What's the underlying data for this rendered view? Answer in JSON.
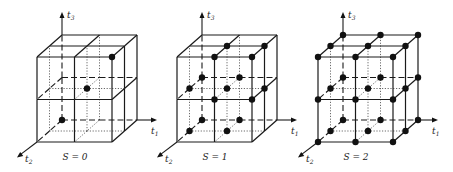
{
  "figure": {
    "background": "#ffffff",
    "ink_color": "#111111",
    "panels": [
      {
        "id": "s0",
        "caption": "S = 0",
        "origin_x": 37,
        "axis_labels": {
          "t1": "t",
          "t1_sub": "1",
          "t2": "t",
          "t2_sub": "2",
          "t3": "t",
          "t3_sub": "3"
        },
        "points": [
          [
            0,
            0,
            0
          ],
          [
            1,
            1,
            1
          ],
          [
            2,
            2,
            2
          ]
        ]
      },
      {
        "id": "s1",
        "caption": "S = 1",
        "origin_x": 177,
        "axis_labels": {
          "t1": "t",
          "t1_sub": "1",
          "t2": "t",
          "t2_sub": "2",
          "t3": "t",
          "t3_sub": "3"
        },
        "points": [
          [
            0,
            0,
            0
          ],
          [
            1,
            0,
            0
          ],
          [
            0,
            1,
            0
          ],
          [
            1,
            1,
            0
          ],
          [
            0,
            0,
            1
          ],
          [
            1,
            0,
            1
          ],
          [
            0,
            1,
            1
          ],
          [
            1,
            1,
            1
          ],
          [
            2,
            1,
            1
          ],
          [
            1,
            2,
            1
          ],
          [
            2,
            2,
            1
          ],
          [
            1,
            1,
            2
          ],
          [
            2,
            1,
            2
          ],
          [
            1,
            2,
            2
          ],
          [
            2,
            2,
            2
          ]
        ]
      },
      {
        "id": "s2",
        "caption": "S = 2",
        "origin_x": 318,
        "axis_labels": {
          "t1": "t",
          "t1_sub": "1",
          "t2": "t",
          "t2_sub": "2",
          "t3": "t",
          "t3_sub": "3"
        },
        "points": "all"
      }
    ],
    "geometry": {
      "front_top_y": 57,
      "front_bottom_y": 142,
      "front_width": 75,
      "depth_dx": 25,
      "depth_dy": -22,
      "t3_axis_top_y": 12,
      "t1_axis_extra": 20,
      "t2_axis_extra": 20
    }
  }
}
